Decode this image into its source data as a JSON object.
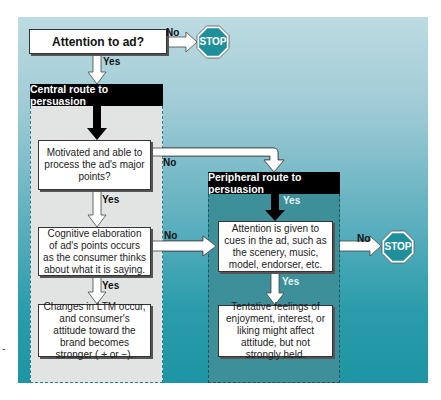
{
  "diagram": {
    "start": {
      "label": "Attention to ad?"
    },
    "stop_label": "STOP",
    "edge_labels": {
      "yes": "Yes",
      "no": "No"
    },
    "central": {
      "header": "Central route to persuasion",
      "steps": [
        "Motivated and able to process the ad's major points?",
        "Cognitive elaboration of ad's points occurs as the consumer thinks about what it is saying.",
        "Changes in LTM occur, and consumer's attitude toward the brand becomes stronger ( + or −)."
      ]
    },
    "peripheral": {
      "header": "Peripheral route to persuasion",
      "steps": [
        "Attention is given to cues in the ad, such as the scenery, music, model, endorser, etc.",
        "Tentative feelings of enjoyment, interest, or liking might affect attitude, but not strongly held."
      ]
    },
    "side_mark": "-",
    "colors": {
      "panel_top": "#bddbe2",
      "panel_bottom": "#1e95a4",
      "stop_fill": "#1f8f9c",
      "header_bg": "#000000",
      "central_region": "#e2e4e4",
      "peripheral_region": "#3d8f99"
    }
  }
}
